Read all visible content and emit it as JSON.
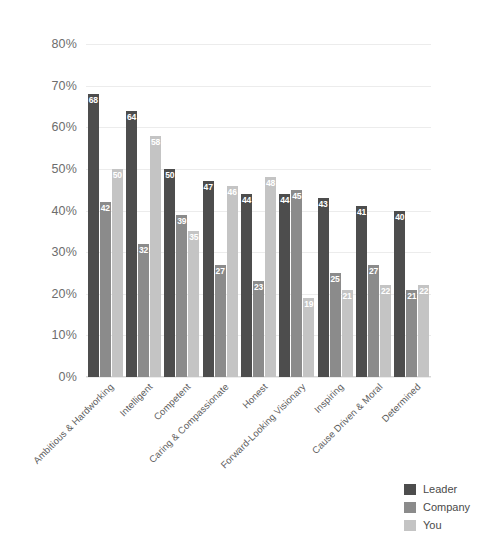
{
  "chart_data": {
    "type": "bar",
    "title": "",
    "xlabel": "",
    "ylabel": "",
    "ylim": [
      0,
      80
    ],
    "grid": true,
    "legend_position": "bottom-right",
    "ytick_labels": [
      "0%",
      "10%",
      "20%",
      "30%",
      "40%",
      "50%",
      "60%",
      "70%",
      "80%"
    ],
    "ytick_values": [
      0,
      10,
      20,
      30,
      40,
      50,
      60,
      70,
      80
    ],
    "categories": [
      "Ambitious & Hardworking",
      "Intelligent",
      "Competent",
      "Caring & Compassionate",
      "Honest",
      "Forward-Looking Visionary",
      "Inspiring",
      "Cause Driven & Moral",
      "Determined"
    ],
    "series": [
      {
        "name": "Leader",
        "color": "#4d4d4d",
        "values": [
          68,
          64,
          50,
          47,
          44,
          44,
          43,
          41,
          40
        ]
      },
      {
        "name": "Company",
        "color": "#8b8b8b",
        "values": [
          42,
          32,
          39,
          27,
          23,
          45,
          25,
          27,
          21
        ]
      },
      {
        "name": "You",
        "color": "#c4c4c4",
        "values": [
          50,
          58,
          35,
          46,
          48,
          19,
          21,
          22,
          22
        ]
      }
    ]
  },
  "legend": {
    "items": [
      {
        "label": "Leader"
      },
      {
        "label": "Company"
      },
      {
        "label": "You"
      }
    ]
  },
  "colors": {
    "leader": "#4d4d4d",
    "company": "#8b8b8b",
    "you": "#c4c4c4",
    "gridline": "#ececec",
    "axis_text": "#6d6d6d",
    "background": "#ffffff"
  }
}
